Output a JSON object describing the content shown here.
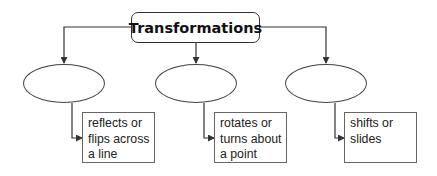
{
  "diagram": {
    "title": "Transformations",
    "branches": [
      {
        "name": "reflection",
        "term": "",
        "definition_lines": [
          "reflects or",
          "flips across",
          "a line"
        ]
      },
      {
        "name": "rotation",
        "term": "",
        "definition_lines": [
          "rotates or",
          "turns about",
          "a point"
        ]
      },
      {
        "name": "translation",
        "term": "",
        "definition_lines": [
          "shifts or",
          "slides"
        ]
      }
    ],
    "colors": {
      "line": "#333333",
      "border": "#444444",
      "text": "#222222",
      "background": "#ffffff"
    }
  }
}
